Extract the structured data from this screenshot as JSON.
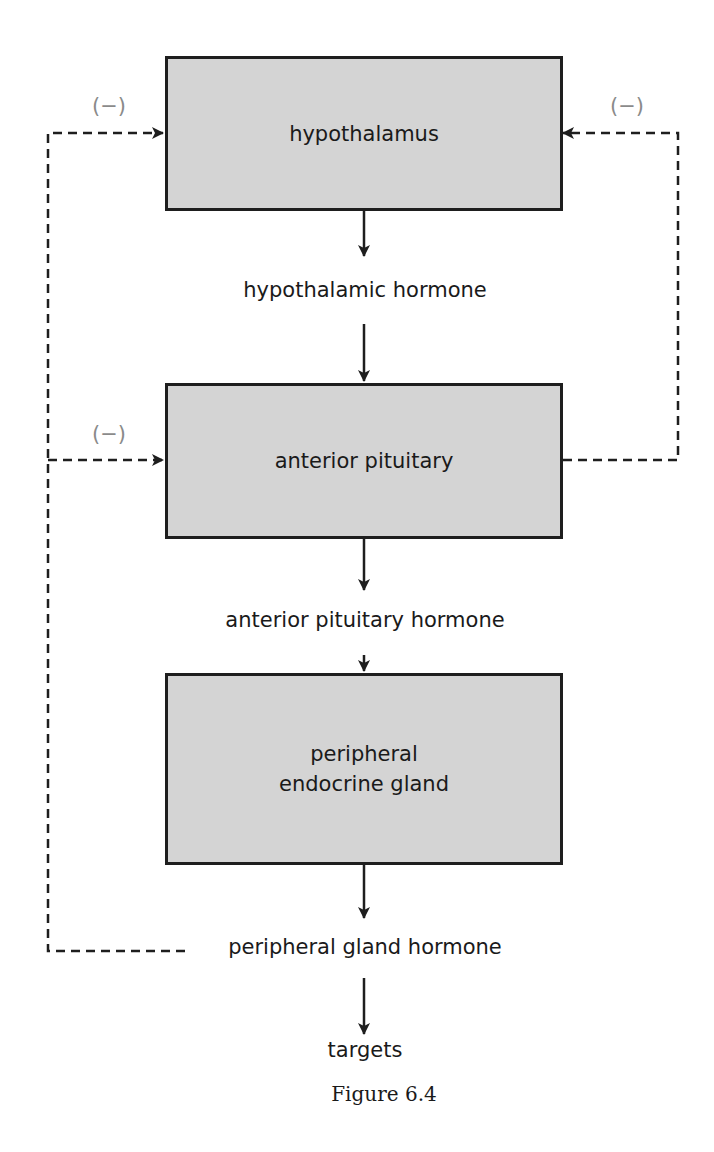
{
  "diagram": {
    "boxes": {
      "hypothalamus": "hypothalamus",
      "anterior_pituitary": "anterior pituitary",
      "peripheral_gland": "peripheral endocrine gland"
    },
    "labels": {
      "hypothalamic_hormone": "hypothalamic hormone",
      "anterior_pituitary_hormone": "anterior pituitary hormone",
      "peripheral_gland_hormone": "peripheral gland hormone",
      "targets": "targets"
    },
    "feedback_symbol": "(−)",
    "caption": "Figure 6.4",
    "colors": {
      "box_fill": "#d4d4d4",
      "stroke": "#1e1e1e",
      "feedback_label": "#8a8a8a"
    }
  }
}
